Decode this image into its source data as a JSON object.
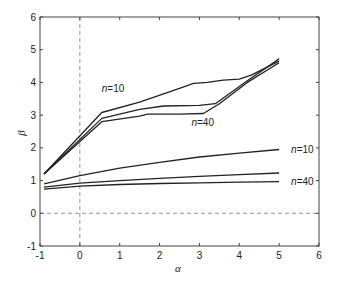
{
  "chart_data": {
    "type": "line",
    "title": "",
    "xlabel": "α",
    "ylabel": "β",
    "xlim": [
      -1,
      6
    ],
    "ylim": [
      -1,
      6
    ],
    "xticks": [
      -1,
      0,
      1,
      2,
      3,
      4,
      5,
      6
    ],
    "yticks": [
      -1,
      0,
      1,
      2,
      3,
      4,
      5,
      6
    ],
    "grid": false,
    "legend": null,
    "reference_lines": [
      {
        "orientation": "vertical",
        "value": 0,
        "style": "dashed"
      },
      {
        "orientation": "horizontal",
        "value": 0,
        "style": "dashed"
      }
    ],
    "annotations": [
      {
        "text": "n=10",
        "x": 0.55,
        "y": 3.8
      },
      {
        "text": "n=40",
        "x": 2.8,
        "y": 2.75
      },
      {
        "text": "n=10",
        "x": 5.3,
        "y": 1.93
      },
      {
        "text": "n=40",
        "x": 5.3,
        "y": 0.95
      }
    ],
    "series": [
      {
        "name": "upper n=10",
        "x": [
          -0.9,
          0.55,
          1.5,
          2.5,
          2.85,
          3.2,
          3.6,
          4.0,
          4.3,
          5.0
        ],
        "y": [
          1.2,
          3.08,
          3.4,
          3.82,
          3.97,
          4.0,
          4.07,
          4.1,
          4.22,
          4.65
        ]
      },
      {
        "name": "upper middle",
        "x": [
          -0.9,
          0.55,
          1.5,
          2.1,
          3.0,
          3.4,
          4.2,
          5.0
        ],
        "y": [
          1.2,
          2.9,
          3.18,
          3.28,
          3.3,
          3.35,
          4.05,
          4.72
        ]
      },
      {
        "name": "upper n=40",
        "x": [
          -0.9,
          0.55,
          1.5,
          1.7,
          2.5,
          3.1,
          3.5,
          4.2,
          5.0
        ],
        "y": [
          1.2,
          2.8,
          2.97,
          3.03,
          3.03,
          3.05,
          3.35,
          4.0,
          4.6
        ]
      },
      {
        "name": "lower n=10",
        "x": [
          -0.9,
          0,
          1,
          2,
          3,
          4,
          5
        ],
        "y": [
          0.9,
          1.15,
          1.38,
          1.56,
          1.72,
          1.84,
          1.95
        ]
      },
      {
        "name": "lower middle",
        "x": [
          -0.9,
          0,
          1,
          2,
          3,
          4,
          5
        ],
        "y": [
          0.8,
          0.92,
          1.0,
          1.07,
          1.13,
          1.18,
          1.23
        ]
      },
      {
        "name": "lower n=40",
        "x": [
          -0.9,
          0,
          1,
          2,
          3,
          4,
          5
        ],
        "y": [
          0.74,
          0.83,
          0.88,
          0.91,
          0.93,
          0.95,
          0.97
        ]
      }
    ]
  },
  "labels": {
    "xlabel": "α",
    "ylabel": "β"
  },
  "colors": {
    "line": "#222222",
    "axis": "#444444",
    "dash": "#777777"
  }
}
